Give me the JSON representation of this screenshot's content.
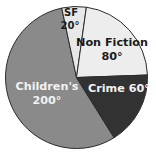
{
  "chart_data": {
    "type": "pie",
    "title": "",
    "subtitle": "",
    "xlabel": "",
    "ylabel": "",
    "legend_position": "none",
    "grid": false,
    "units": "degrees",
    "total_degrees": 360,
    "categories": [
      "SF",
      "Non Fiction",
      "Crime",
      "Children's"
    ],
    "values": [
      20,
      80,
      60,
      200
    ],
    "labels": [
      "SF 20°",
      "Non Fiction 80°",
      "Crime 60°",
      "Children's 200°"
    ],
    "slices": [
      {
        "name": "SF",
        "name_text": "SF",
        "value_text": "20°",
        "degrees": 20,
        "color": "#e8e8e8",
        "label_color": "#1b1b1b"
      },
      {
        "name": "Non Fiction",
        "name_text": "Non Fiction",
        "value_text": "80°",
        "degrees": 80,
        "color": "#ededed",
        "label_color": "#1b1b1b"
      },
      {
        "name": "Crime",
        "name_text": "Crime 60°",
        "value_text": "60°",
        "degrees": 60,
        "color": "#323232",
        "label_color": "#f2f2f2"
      },
      {
        "name": "Children's",
        "name_text": "Children's",
        "value_text": "200°",
        "degrees": 200,
        "color": "#8a8a8a",
        "label_color": "#f2f2f2"
      }
    ],
    "colors": {
      "sf": "#e8e8e8",
      "non_fiction": "#ededed",
      "crime": "#323232",
      "children": "#8a8a8a",
      "outline": "#2b2b2b",
      "background": "#ffffff"
    }
  }
}
